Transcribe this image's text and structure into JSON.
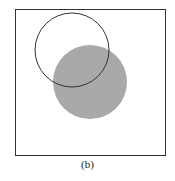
{
  "figure": {
    "caption": "(b)",
    "frame": {
      "x": 15,
      "y": 9,
      "width": 150,
      "height": 146,
      "stroke": "#333333"
    },
    "outline_circle": {
      "cx": 72,
      "cy": 50,
      "r": 37,
      "stroke": "#333333"
    },
    "filled_circle": {
      "cx": 90,
      "cy": 82,
      "r": 37,
      "fill": "#a9a9a9"
    }
  }
}
